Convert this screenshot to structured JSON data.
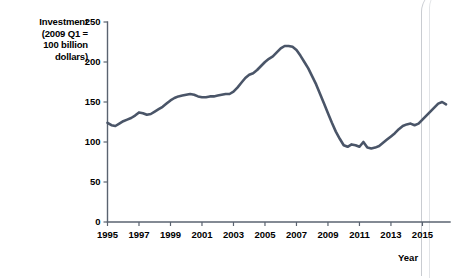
{
  "chart_data": {
    "type": "line",
    "title": "",
    "subtitle": "",
    "ylabel_lines": [
      "Investment",
      "(2009 Q1 =",
      "100 billion",
      "dollars)"
    ],
    "ylabel": "Investment (2009 Q1 = 100 billion dollars)",
    "xlabel": "Year",
    "xlim": [
      1995,
      2016.75
    ],
    "ylim": [
      0,
      250
    ],
    "yticks": [
      0,
      50,
      100,
      150,
      200,
      250
    ],
    "ytick_labels": [
      "0",
      "50",
      "100",
      "150",
      "200",
      "250"
    ],
    "xticks": [
      1995,
      1997,
      1999,
      2001,
      2003,
      2005,
      2007,
      2009,
      2011,
      2013,
      2015
    ],
    "xtick_labels": [
      "1995",
      "1997",
      "1999",
      "2001",
      "2003",
      "2005",
      "2007",
      "2009",
      "2011",
      "2013",
      "2015"
    ],
    "grid": false,
    "legend": null,
    "legend_position": "none",
    "series": [
      {
        "name": "Investment",
        "color": "#4a5568",
        "line_width": 2.6,
        "x": [
          1995.0,
          1995.25,
          1995.5,
          1995.75,
          1996.0,
          1996.25,
          1996.5,
          1996.75,
          1997.0,
          1997.25,
          1997.5,
          1997.75,
          1998.0,
          1998.25,
          1998.5,
          1998.75,
          1999.0,
          1999.25,
          1999.5,
          1999.75,
          2000.0,
          2000.25,
          2000.5,
          2000.75,
          2001.0,
          2001.25,
          2001.5,
          2001.75,
          2002.0,
          2002.25,
          2002.5,
          2002.75,
          2003.0,
          2003.25,
          2003.5,
          2003.75,
          2004.0,
          2004.25,
          2004.5,
          2004.75,
          2005.0,
          2005.25,
          2005.5,
          2005.75,
          2006.0,
          2006.25,
          2006.5,
          2006.75,
          2007.0,
          2007.25,
          2007.5,
          2007.75,
          2008.0,
          2008.25,
          2008.5,
          2008.75,
          2009.0,
          2009.25,
          2009.5,
          2009.75,
          2010.0,
          2010.25,
          2010.5,
          2010.75,
          2011.0,
          2011.25,
          2011.5,
          2011.75,
          2012.0,
          2012.25,
          2012.5,
          2012.75,
          2013.0,
          2013.25,
          2013.5,
          2013.75,
          2014.0,
          2014.25,
          2014.5,
          2014.75,
          2015.0,
          2015.25,
          2015.5,
          2015.75,
          2016.0,
          2016.25,
          2016.5
        ],
        "values": [
          124,
          121,
          120,
          123,
          126,
          128,
          130,
          133,
          137,
          136,
          134,
          135,
          138,
          141,
          144,
          148,
          152,
          155,
          157,
          158,
          159,
          160,
          159,
          157,
          156,
          156,
          157,
          157,
          158,
          159,
          160,
          160,
          163,
          168,
          174,
          180,
          184,
          186,
          190,
          195,
          200,
          204,
          207,
          212,
          217,
          220,
          220,
          219,
          215,
          208,
          200,
          192,
          182,
          172,
          160,
          148,
          136,
          124,
          113,
          104,
          96,
          94,
          97,
          96,
          94,
          100,
          93,
          92,
          93,
          95,
          99,
          103,
          107,
          111,
          116,
          120,
          122,
          123,
          121,
          123,
          128,
          133,
          138,
          143,
          148,
          150,
          147
        ]
      }
    ],
    "annotations": [],
    "notes": {
      "peak_value": 220,
      "peak_year": 2006.25,
      "trough_value": 92,
      "trough_year": 2011.75,
      "start_value": 124,
      "end_value": 147
    }
  },
  "axis_style": {
    "axis_color": "#5a6370",
    "tick_color": "#5a6370",
    "label_color": "#000000",
    "background": "#ffffff"
  }
}
